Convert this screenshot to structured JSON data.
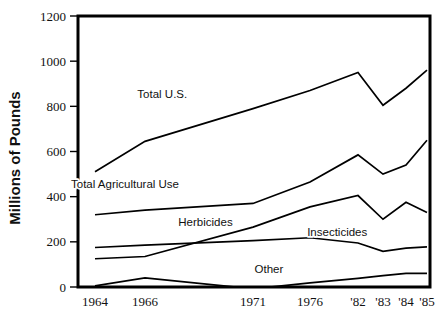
{
  "chart_data": {
    "type": "line",
    "title": "",
    "xlabel": "",
    "ylabel": "Millions of Pounds",
    "ylim": [
      0,
      1200
    ],
    "yticks": [
      0,
      200,
      400,
      600,
      800,
      1000,
      1200
    ],
    "ytick_labels": [
      "0",
      "200",
      "400",
      "600",
      "800",
      "1000",
      "1200"
    ],
    "categories": [
      "1964",
      "1966",
      "1971",
      "1976",
      "'82",
      "'83",
      "'84",
      "'85"
    ],
    "xtick_labels": [
      "1964",
      "1966",
      "1971",
      "1976",
      "'82",
      "'83",
      "'84",
      "'85"
    ],
    "grid": false,
    "legend": "inline-labels",
    "series": [
      {
        "name": "Total U.S.",
        "label": "Total U.S.",
        "values": [
          510,
          645,
          790,
          870,
          950,
          805,
          880,
          960
        ]
      },
      {
        "name": "Total Agricultural Use",
        "label": "Total Agricultural Use",
        "values": [
          320,
          340,
          370,
          465,
          585,
          500,
          540,
          650
        ]
      },
      {
        "name": "Herbicides",
        "label": "Herbicides",
        "values": [
          125,
          135,
          265,
          355,
          405,
          300,
          375,
          330
        ]
      },
      {
        "name": "Insecticides",
        "label": "Insecticides",
        "values": [
          175,
          185,
          205,
          218,
          195,
          158,
          172,
          178
        ]
      },
      {
        "name": "Other",
        "label": "Other",
        "values": [
          5,
          40,
          -8,
          18,
          38,
          50,
          60,
          60
        ]
      }
    ],
    "annotations": [
      {
        "text": "Total U.S.",
        "x": 1966.8,
        "y": 838
      },
      {
        "text": "Total Agricultural Use",
        "x": 1965.2,
        "y": 437
      },
      {
        "text": "Herbicides",
        "x": 1968.8,
        "y": 270
      },
      {
        "text": "Insecticides",
        "x": 1979.4,
        "y": 228
      },
      {
        "text": "Other",
        "x": 1972.4,
        "y": 62
      }
    ],
    "colors": {
      "line": "#000000",
      "frame": "#000000",
      "text": "#111111",
      "background": "#ffffff"
    }
  }
}
